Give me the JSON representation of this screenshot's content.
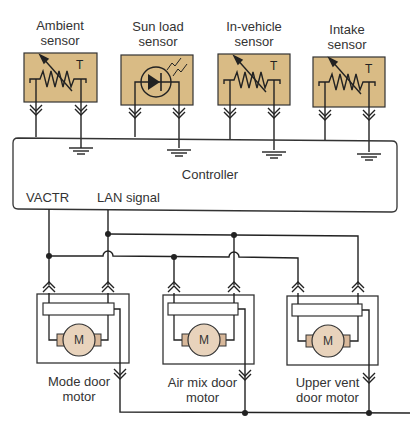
{
  "sensors": [
    {
      "label_line1": "Ambient",
      "label_line2": "sensor",
      "type": "thermistor",
      "symbol": "T"
    },
    {
      "label_line1": "Sun load",
      "label_line2": "sensor",
      "type": "photodiode"
    },
    {
      "label_line1": "In-vehicle",
      "label_line2": "sensor",
      "type": "thermistor",
      "symbol": "T"
    },
    {
      "label_line1": "Intake",
      "label_line2": "sensor",
      "type": "thermistor",
      "symbol": "T"
    }
  ],
  "controller": {
    "label": "Controller",
    "pin_vactr": "VACTR",
    "pin_lan": "LAN signal"
  },
  "motors": [
    {
      "label_line1": "Mode door",
      "label_line2": "motor",
      "symbol": "M"
    },
    {
      "label_line1": "Air mix door",
      "label_line2": "motor",
      "symbol": "M"
    },
    {
      "label_line1": "Upper vent",
      "label_line2": "door motor",
      "symbol": "M"
    }
  ],
  "colors": {
    "sensor_fill": "#d9bb85",
    "motor_fill": "#e8d3bc",
    "line": "#222222"
  }
}
